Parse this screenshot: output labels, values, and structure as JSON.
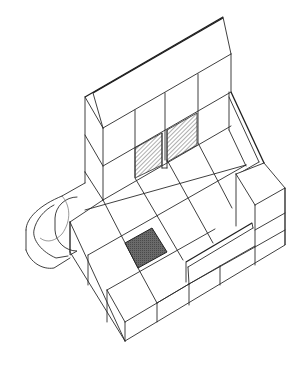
{
  "drawing": {
    "title": "",
    "type": "axonometric architectural line drawing",
    "style": "black ink line on white",
    "colors": {
      "background": "#ffffff",
      "line": "#2a2a2a",
      "hatch": "#333333",
      "dark_tile": "#555555"
    },
    "elements": {
      "gabled_building": "pitched-roof block at rear with gable end facing left",
      "doors": [
        "hatched door left",
        "hatched door right"
      ],
      "courtyard": "open tiled courtyard in a 3x3 grid enclosed by low walls",
      "dark_tile": "single dark shaded floor square",
      "semicircle_block": "half-round projection on left side",
      "right_block": "raised rectangular block on right edge with low bench wall",
      "bench": "low thin wall/bench in front of right block"
    }
  }
}
